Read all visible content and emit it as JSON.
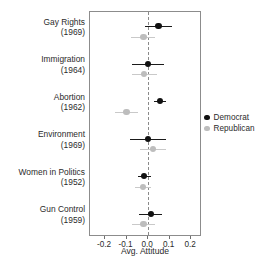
{
  "chart_data": {
    "type": "scatter",
    "title": "",
    "subtitle": "",
    "xlabel": "Avg. Attitude",
    "ylabel": "",
    "xlim": [
      -0.27,
      0.25
    ],
    "xticks": [
      -0.2,
      -0.1,
      0.0,
      0.1,
      0.2
    ],
    "xticklabels": [
      "-0.2",
      "-0.1",
      "0.0",
      "0.1",
      "0.2"
    ],
    "grid": false,
    "zero_reference_line": 0.0,
    "zero_line_style": "dashed",
    "legend_position": "right",
    "categories": [
      {
        "label": "Gay Rights",
        "year": "(1969)"
      },
      {
        "label": "Immigration",
        "year": "(1964)"
      },
      {
        "label": "Abortion",
        "year": "(1962)"
      },
      {
        "label": "Environment",
        "year": "(1969)"
      },
      {
        "label": "Women in Politics",
        "year": "(1952)"
      },
      {
        "label": "Gun Control",
        "year": "(1959)"
      }
    ],
    "series": [
      {
        "name": "Democrat",
        "color": "#111111",
        "values": [
          0.048,
          0.0,
          0.055,
          0.0,
          -0.018,
          0.012
        ],
        "ci_low": [
          -0.013,
          -0.073,
          0.027,
          -0.082,
          -0.048,
          -0.042
        ],
        "ci_high": [
          0.11,
          0.072,
          0.083,
          0.083,
          0.012,
          0.065
        ]
      },
      {
        "name": "Republican",
        "color": "#bdbdbd",
        "values": [
          -0.022,
          -0.018,
          -0.1,
          0.022,
          -0.025,
          -0.022
        ],
        "ci_low": [
          -0.078,
          -0.075,
          -0.152,
          -0.04,
          -0.062,
          -0.075
        ],
        "ci_high": [
          0.032,
          0.04,
          -0.048,
          0.085,
          0.012,
          0.032
        ]
      }
    ]
  },
  "legend": {
    "items": [
      {
        "label": "Democrat",
        "color": "#111111"
      },
      {
        "label": "Republican",
        "color": "#bdbdbd"
      }
    ]
  },
  "axis": {
    "xlabel": "Avg. Attitude"
  }
}
